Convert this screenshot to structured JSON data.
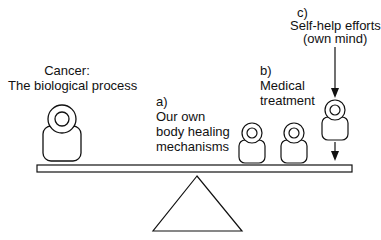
{
  "diagram": {
    "labels": {
      "cancer_line1": "Cancer:",
      "cancer_line2": "The biological process",
      "a_tag": "a)",
      "a_line1": "Our own",
      "a_line2": "body healing",
      "a_line3": "mechanisms",
      "b_tag": "b)",
      "b_line1": "Medical",
      "b_line2": "treatment",
      "c_tag": "c)",
      "c_line1": "Self-help efforts",
      "c_line2": "(own mind)"
    },
    "weights": [
      {
        "id": "cancer",
        "size": "large"
      },
      {
        "id": "medical-1",
        "size": "small"
      },
      {
        "id": "medical-2",
        "size": "small"
      },
      {
        "id": "self-help",
        "size": "small",
        "falling": true
      }
    ],
    "colors": {
      "stroke": "#111111",
      "background": "#ffffff"
    }
  }
}
